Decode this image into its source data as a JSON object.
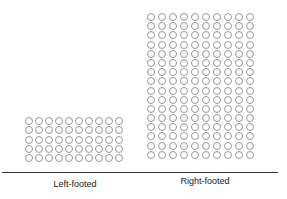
{
  "chart_data": {
    "type": "pictogram",
    "title": "",
    "xlabel": "",
    "ylabel": "",
    "categories": [
      "Left-footed",
      "Right-footed"
    ],
    "values": [
      50,
      160
    ],
    "unit_symbol": "circle",
    "grid_columns": 10,
    "rows": [
      5,
      16
    ],
    "axis_line": true,
    "grid": false,
    "legend": null
  },
  "labels": {
    "left": "Left-footed",
    "right": "Right-footed"
  },
  "colors": {
    "dot_stroke": "#9a9a9a",
    "axis": "#333333",
    "text": "#222222"
  }
}
